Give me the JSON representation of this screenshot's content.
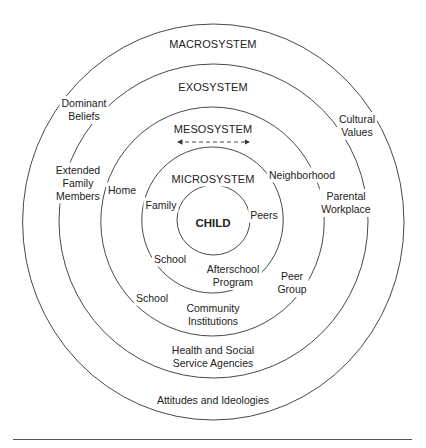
{
  "diagram": {
    "type": "concentric-circles",
    "colors": {
      "stroke": "#333333",
      "text": "#222222",
      "background": "#ffffff"
    },
    "rings": [
      {
        "id": "child",
        "label": "CHILD",
        "cx": 213.5,
        "cy": 220,
        "rx": 36.5,
        "ry": 35
      },
      {
        "id": "microsystem",
        "label": "MICROSYSTEM",
        "cx": 212.5,
        "cy": 220,
        "rx": 70.7,
        "ry": 73
      },
      {
        "id": "mesosystem",
        "label": "MESOSYSTEM",
        "cx": 212.5,
        "cy": 221.5,
        "rx": 111.7,
        "ry": 114.5
      },
      {
        "id": "exosystem",
        "label": "EXOSYSTEM",
        "cx": 213.5,
        "cy": 221,
        "rx": 154.5,
        "ry": 157
      },
      {
        "id": "macrosystem",
        "label": "MACROSYSTEM",
        "cx": 213.3,
        "cy": 222,
        "rx": 190.7,
        "ry": 198
      }
    ],
    "system_labels": {
      "macrosystem": "MACROSYSTEM",
      "exosystem": "EXOSYSTEM",
      "mesosystem": "MESOSYSTEM",
      "microsystem": "MICROSYSTEM",
      "child": "CHILD"
    },
    "mesosystem_arrow": {
      "x1": 175,
      "x2": 252,
      "y": 142,
      "style": "dashed",
      "direction": "both"
    },
    "elements": {
      "dominant_beliefs": "Dominant\nBeliefs",
      "extended_family_members": "Extended\nFamily\nMembers",
      "home": "Home",
      "family": "Family",
      "peers": "Peers",
      "neighborhood": "Neighborhood",
      "cultural_values": "Cultural\nValues",
      "parental_workplace": "Parental\nWorkplace",
      "school_inner": "School",
      "afterschool_program": "Afterschool\nProgram",
      "peer_group": "Peer\nGroup",
      "school_outer": "School",
      "community_institutions": "Community\nInstitutions",
      "health_social_service": "Health and Social\nService Agencies",
      "attitudes_ideologies": "Attitudes and Ideologies"
    }
  }
}
